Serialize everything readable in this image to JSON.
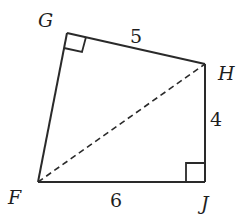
{
  "diagram": {
    "type": "quadrilateral",
    "vertices": [
      {
        "name": "G",
        "x": 67,
        "y": 33,
        "label_x": 33,
        "label_y": 27
      },
      {
        "name": "H",
        "x": 205,
        "y": 64,
        "label_x": 218,
        "label_y": 80
      },
      {
        "name": "J",
        "x": 205,
        "y": 182,
        "label_x": 200,
        "label_y": 208
      },
      {
        "name": "F",
        "x": 38,
        "y": 182,
        "label_x": 8,
        "label_y": 204
      }
    ],
    "side_labels": [
      {
        "side": "GH",
        "value": "5",
        "x": 128,
        "y": 43
      },
      {
        "side": "HJ",
        "value": "4",
        "x": 209,
        "y": 124
      },
      {
        "side": "FJ",
        "value": "6",
        "x": 108,
        "y": 206
      }
    ],
    "diagonal": {
      "from": "F",
      "to": "H",
      "style": "dashed"
    },
    "right_angles": [
      "G",
      "J"
    ],
    "stroke_color": "#2a2a2a"
  }
}
